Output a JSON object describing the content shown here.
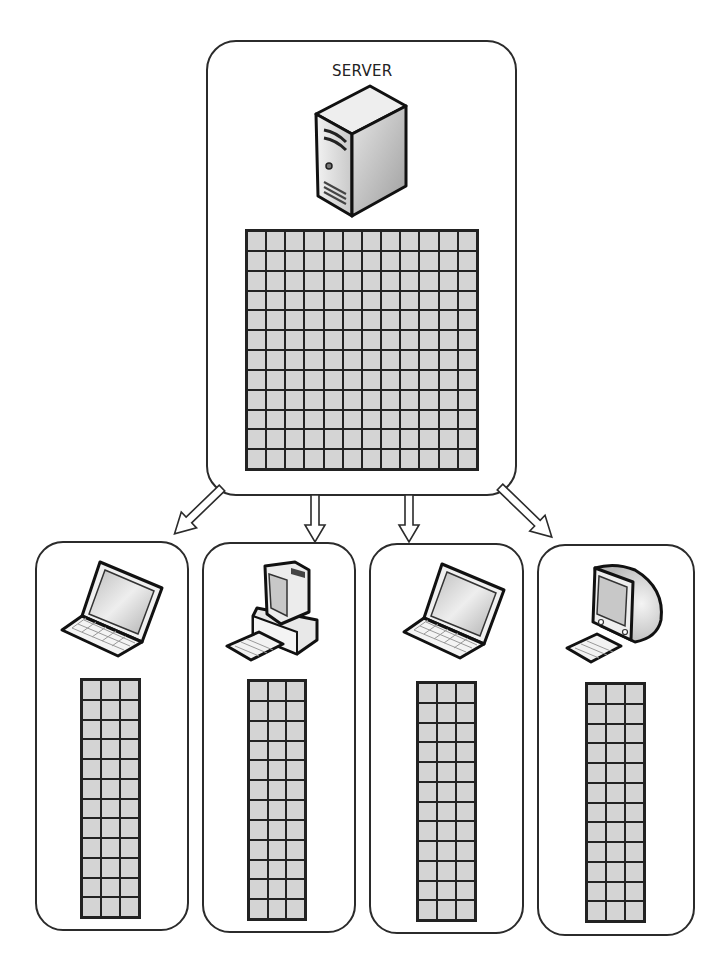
{
  "diagram": {
    "type": "client-server data distribution",
    "server": {
      "label": "SERVER",
      "icon": "server-tower-icon",
      "grid": {
        "columns": 12,
        "rows": 12
      }
    },
    "clients": [
      {
        "icon": "laptop-icon",
        "grid": {
          "columns": 3,
          "rows": 12
        }
      },
      {
        "icon": "desktop-computer-icon",
        "grid": {
          "columns": 3,
          "rows": 12
        }
      },
      {
        "icon": "laptop-icon",
        "grid": {
          "columns": 3,
          "rows": 12
        }
      },
      {
        "icon": "crt-monitor-icon",
        "grid": {
          "columns": 3,
          "rows": 12
        }
      }
    ],
    "edges": [
      {
        "from": "server",
        "to": "client-1",
        "style": "hollow-arrow"
      },
      {
        "from": "server",
        "to": "client-2",
        "style": "hollow-arrow"
      },
      {
        "from": "server",
        "to": "client-3",
        "style": "hollow-arrow"
      },
      {
        "from": "server",
        "to": "client-4",
        "style": "hollow-arrow"
      }
    ],
    "colors": {
      "outline": "#2b2b2b",
      "cell_fill": "#d4d4d4",
      "background": "#ffffff"
    }
  }
}
